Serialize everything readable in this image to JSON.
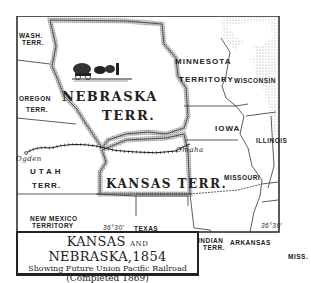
{
  "title": {
    "main_part1": "KANSAS",
    "main_and": "AND",
    "main_part2": "NEBRASKA,1854",
    "subtitle": "Showing Future Union Pacific Railroad",
    "completed": "(Completed 1869)"
  },
  "regions": {
    "wash_terr": [
      "WASH.",
      "TERR."
    ],
    "oregon_terr": [
      "OREGON",
      "TERR."
    ],
    "nebraska_terr": [
      "NEBRASKA",
      "TERR."
    ],
    "minnesota_territory": [
      "MINNESOTA",
      "TERRITORY"
    ],
    "wisconsin": "WISCONSIN",
    "iowa": "IOWA",
    "illinois": "ILLINOIS",
    "utah_terr": [
      "UTAH",
      "TERR."
    ],
    "kansas_terr": "KANSAS TERR.",
    "missouri": "MISSOURI",
    "new_mexico_territory": [
      "NEW MEXICO",
      "TERRITORY"
    ],
    "texas": "TEXAS",
    "indian_terr": [
      "INDIAN",
      "TERR."
    ],
    "arkansas": "ARKANSAS",
    "miss": "MISS."
  },
  "cities": {
    "ogden": "Ogden",
    "omaha": "Omaha"
  },
  "parallels": {
    "west": "36°30'",
    "east": "36°30'"
  },
  "colors": {
    "ink": "#222222",
    "territory_border_shade": "#b5b5b5",
    "background": "#ffffff",
    "water_stipple": "#9a9a9a"
  }
}
